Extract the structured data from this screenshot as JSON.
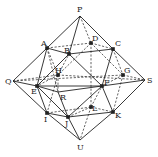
{
  "diagram": {
    "type": "polyhedron-inscribed-in-octahedron",
    "line_color": "#222222",
    "vertices": [
      {
        "id": "P",
        "x": 80,
        "y": 16,
        "dot": false,
        "lx": 77,
        "ly": 12
      },
      {
        "id": "A",
        "x": 47,
        "y": 48,
        "dot": true,
        "lx": 41,
        "ly": 46
      },
      {
        "id": "B",
        "x": 69,
        "y": 54,
        "dot": true,
        "lx": 64,
        "ly": 53
      },
      {
        "id": "D",
        "x": 91,
        "y": 43,
        "dot": true,
        "lx": 92,
        "ly": 41
      },
      {
        "id": "C",
        "x": 113,
        "y": 49,
        "dot": true,
        "lx": 115,
        "ly": 46
      },
      {
        "id": "Q",
        "x": 13,
        "y": 81,
        "dot": false,
        "lx": 5,
        "ly": 84
      },
      {
        "id": "H",
        "x": 58,
        "y": 75,
        "dot": true,
        "lx": 55,
        "ly": 73
      },
      {
        "id": "G",
        "x": 123,
        "y": 75,
        "dot": true,
        "lx": 124,
        "ly": 73
      },
      {
        "id": "S",
        "x": 145,
        "y": 80,
        "dot": false,
        "lx": 147,
        "ly": 83
      },
      {
        "id": "E",
        "x": 37,
        "y": 86,
        "dot": true,
        "lx": 31,
        "ly": 94
      },
      {
        "id": "F",
        "x": 102,
        "y": 86,
        "dot": true,
        "lx": 104,
        "ly": 85
      },
      {
        "id": "R",
        "x": 58,
        "y": 92,
        "dot": false,
        "lx": 60,
        "ly": 100
      },
      {
        "id": "L",
        "x": 91,
        "y": 107,
        "dot": true,
        "lx": 92,
        "ly": 111
      },
      {
        "id": "I",
        "x": 47,
        "y": 113,
        "dot": true,
        "lx": 44,
        "ly": 122
      },
      {
        "id": "J",
        "x": 68,
        "y": 117,
        "dot": true,
        "lx": 65,
        "ly": 126
      },
      {
        "id": "K",
        "x": 113,
        "y": 112,
        "dot": true,
        "lx": 115,
        "ly": 118
      },
      {
        "id": "U",
        "x": 80,
        "y": 140,
        "dot": false,
        "lx": 77,
        "ly": 150
      }
    ],
    "solid_edges": [
      [
        "P",
        "A"
      ],
      [
        "A",
        "Q"
      ],
      [
        "P",
        "C"
      ],
      [
        "C",
        "S"
      ],
      [
        "Q",
        "I"
      ],
      [
        "I",
        "U"
      ],
      [
        "S",
        "K"
      ],
      [
        "K",
        "U"
      ],
      [
        "P",
        "B"
      ],
      [
        "A",
        "B"
      ],
      [
        "B",
        "C"
      ],
      [
        "A",
        "E"
      ],
      [
        "B",
        "E"
      ],
      [
        "B",
        "F"
      ],
      [
        "C",
        "F"
      ],
      [
        "Q",
        "E"
      ],
      [
        "E",
        "F"
      ],
      [
        "F",
        "S"
      ],
      [
        "E",
        "I"
      ],
      [
        "E",
        "J"
      ],
      [
        "I",
        "J"
      ],
      [
        "J",
        "F"
      ],
      [
        "J",
        "K"
      ],
      [
        "F",
        "K"
      ],
      [
        "J",
        "U"
      ],
      [
        "E",
        "R"
      ],
      [
        "R",
        "J"
      ],
      [
        "R",
        "F"
      ]
    ],
    "dashed_edges": [
      [
        "P",
        "D"
      ],
      [
        "A",
        "D"
      ],
      [
        "D",
        "C"
      ],
      [
        "Q",
        "H"
      ],
      [
        "H",
        "S"
      ],
      [
        "Q",
        "G"
      ],
      [
        "G",
        "S"
      ],
      [
        "A",
        "H"
      ],
      [
        "H",
        "B"
      ],
      [
        "D",
        "H"
      ],
      [
        "D",
        "G"
      ],
      [
        "C",
        "G"
      ],
      [
        "G",
        "F"
      ],
      [
        "G",
        "K"
      ],
      [
        "H",
        "E"
      ],
      [
        "H",
        "R"
      ],
      [
        "H",
        "I"
      ],
      [
        "I",
        "L"
      ],
      [
        "L",
        "K"
      ],
      [
        "L",
        "J"
      ],
      [
        "L",
        "F"
      ],
      [
        "L",
        "U"
      ],
      [
        "D",
        "L"
      ],
      [
        "A",
        "R"
      ]
    ]
  }
}
